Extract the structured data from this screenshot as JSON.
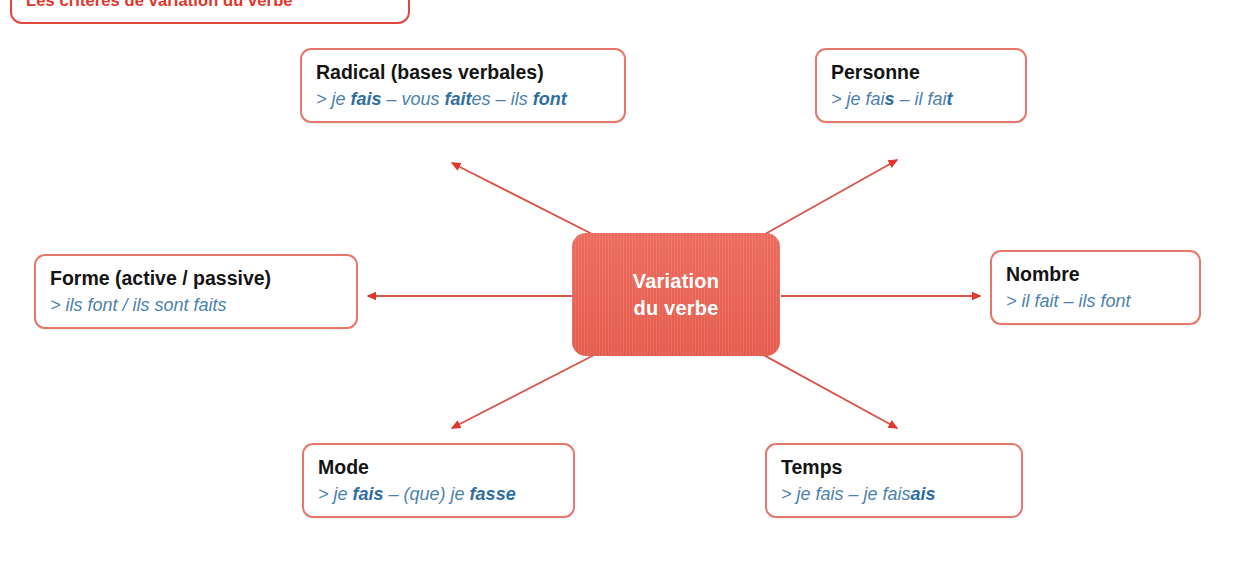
{
  "banner": {
    "title": "Les critères de variation du verbe"
  },
  "center": {
    "line1": "Variation",
    "line2": "du verbe"
  },
  "colors": {
    "center_fill": "#e8645a",
    "box_border": "#e8776b",
    "banner_border": "#e0483c",
    "banner_text": "#e0362b",
    "arrow": "#e0483c",
    "example_text": "#4b82ad",
    "title_text": "#141414"
  },
  "nodes": [
    {
      "id": "radical",
      "title": "Radical (bases verbales)",
      "example_html": "&gt; je <b>fais</b> – vous <b>fait</b>es – ils <b>font</b>",
      "example_plain": "> je fais – vous faites – ils font"
    },
    {
      "id": "personne",
      "title": "Personne",
      "example_html": "&gt; je fai<b>s</b> – il fai<b>t</b>",
      "example_plain": "> je fais – il fait"
    },
    {
      "id": "forme",
      "title": "Forme (active / passive)",
      "example_html": "&gt; ils font / ils sont faits",
      "example_plain": "> ils font / ils sont faits"
    },
    {
      "id": "nombre",
      "title": "Nombre",
      "example_html": "&gt; il fait – ils font",
      "example_plain": "> il fait – ils font"
    },
    {
      "id": "mode",
      "title": "Mode",
      "example_html": "&gt; je <b>fais</b> – (que) je <b>fasse</b>",
      "example_plain": "> je fais – (que) je fasse"
    },
    {
      "id": "temps",
      "title": "Temps",
      "example_html": "&gt; je fais – je fais<b>ais</b>",
      "example_plain": "> je fais – je faisais"
    }
  ],
  "arrows": [
    {
      "name": "arrow-to-radical",
      "from": [
        600,
        238
      ],
      "to": [
        452,
        163
      ]
    },
    {
      "name": "arrow-to-personne",
      "from": [
        758,
        238
      ],
      "to": [
        897,
        160
      ]
    },
    {
      "name": "arrow-to-forme",
      "from": [
        572,
        296
      ],
      "to": [
        368,
        296
      ]
    },
    {
      "name": "arrow-to-nombre",
      "from": [
        781,
        296
      ],
      "to": [
        980,
        296
      ]
    },
    {
      "name": "arrow-to-mode",
      "from": [
        600,
        352
      ],
      "to": [
        452,
        428
      ]
    },
    {
      "name": "arrow-to-temps",
      "from": [
        758,
        352
      ],
      "to": [
        897,
        428
      ]
    }
  ]
}
